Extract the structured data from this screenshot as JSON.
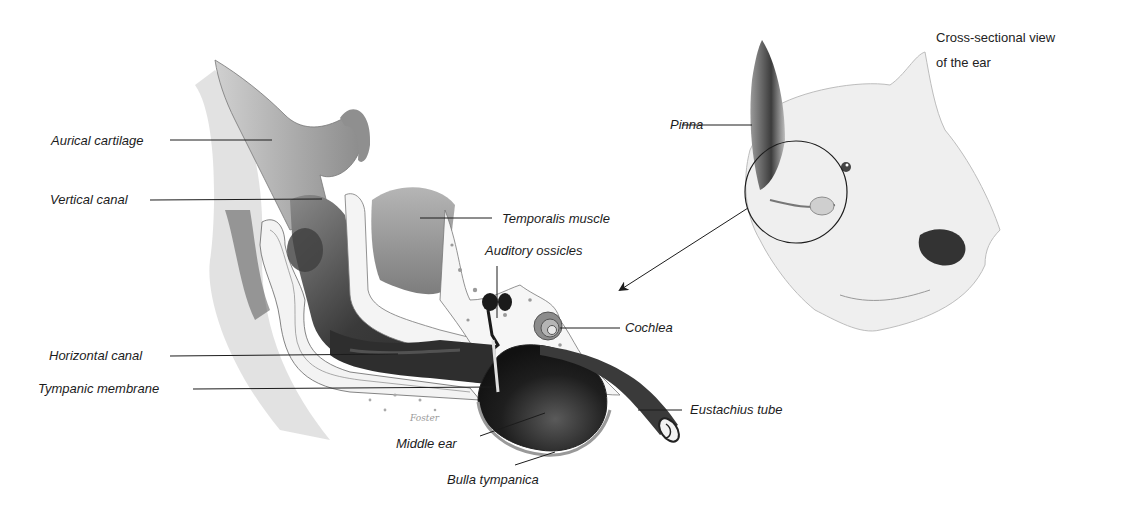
{
  "diagram": {
    "type": "anatomical-illustration",
    "caption": {
      "line1": "Cross-sectional view",
      "line2": "of the ear"
    },
    "labels": {
      "aurical_cartilage": "Aurical cartilage",
      "vertical_canal": "Vertical canal",
      "temporalis_muscle": "Temporalis muscle",
      "auditory_ossicles": "Auditory ossicles",
      "cochlea": "Cochlea",
      "horizontal_canal": "Horizontal canal",
      "tympanic_membrane": "Tympanic membrane",
      "eustachius_tube": "Eustachius tube",
      "middle_ear": "Middle ear",
      "bulla_tympanica": "Bulla tympanica",
      "pinna": "Pinna"
    },
    "artist_signature": "Foster",
    "colors": {
      "background": "#ffffff",
      "ink": "#1c1c1c",
      "shade_dark": "#2a2a2a",
      "shade_mid": "#7a7a7a",
      "shade_light": "#c8c8c8",
      "bone": "#f2f2f2"
    }
  }
}
